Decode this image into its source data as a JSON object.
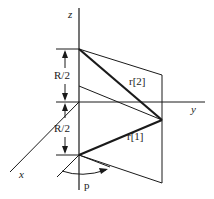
{
  "diagram": {
    "axes": {
      "z_label": "z",
      "y_label": "y",
      "x_label": "x"
    },
    "dimensions": {
      "upper_label": "R/2",
      "lower_label": "R/2"
    },
    "vectors": {
      "r2_label": "r[2]",
      "r1_label": "r[1]"
    },
    "angle_label": "p",
    "colors": {
      "line": "#1a1a1a",
      "background": "#ffffff"
    }
  }
}
